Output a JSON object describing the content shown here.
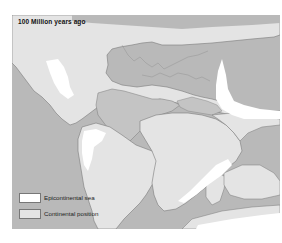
{
  "map": {
    "title": "100 Million years ago",
    "colors": {
      "ocean": "#b9b9b9",
      "continent": "#e4e4e4",
      "epicontinental_sea": "#ffffff",
      "inner_sea": "#c4c4c4",
      "coastline": "#7a7a7a"
    },
    "legend": [
      {
        "label": "Epicontinental sea",
        "swatch": "epicontinental-sea"
      },
      {
        "label": "Continental position",
        "swatch": "continental-position"
      }
    ]
  }
}
